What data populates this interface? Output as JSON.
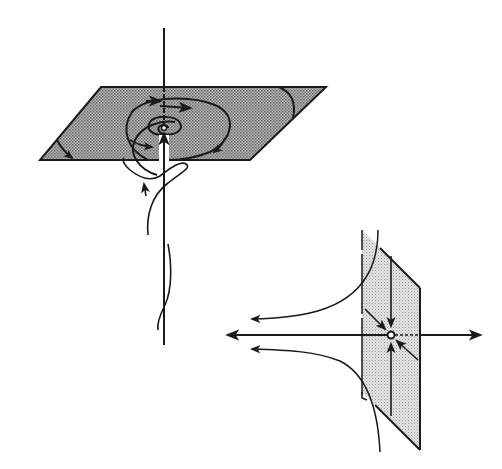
{
  "figure": {
    "colors": {
      "ink": "#1a1a1a",
      "plane_fill_focus": "#9a9a9a",
      "plane_fill_saddle": "#d2d2d2",
      "background": "#ffffff"
    },
    "focus_diagram": {
      "center": [
        164,
        128
      ],
      "axis_top": [
        164,
        28
      ],
      "axis_bottom": [
        164,
        345
      ],
      "plane_corners": [
        [
          101,
          87
        ],
        [
          326,
          87
        ],
        [
          250,
          160
        ],
        [
          40,
          160
        ]
      ]
    },
    "saddle_diagram": {
      "center": [
        391,
        335
      ],
      "axis_left": [
        226,
        335
      ],
      "axis_right": [
        482,
        335
      ],
      "plane_corners": [
        [
          362,
          230
        ],
        [
          420,
          285
        ],
        [
          420,
          450
        ],
        [
          362,
          392
        ]
      ]
    }
  }
}
